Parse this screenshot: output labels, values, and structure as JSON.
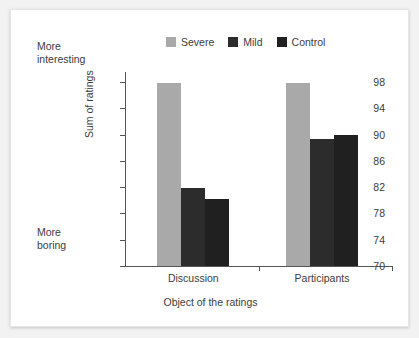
{
  "chart_data": {
    "type": "bar",
    "title": "",
    "xlabel": "Object of the ratings",
    "ylabel": "Sum of ratings",
    "categories": [
      "Discussion",
      "Participants"
    ],
    "series": [
      {
        "name": "Severe",
        "color": "#a9a9a9",
        "values": [
          97.8,
          97.9
        ]
      },
      {
        "name": "Mild",
        "color": "#2c2c2c",
        "values": [
          81.9,
          89.4
        ]
      },
      {
        "name": "Control",
        "color": "#202020",
        "values": [
          80.2,
          89.9
        ]
      }
    ],
    "ylim": [
      70,
      100
    ],
    "yticks": [
      70,
      74,
      78,
      82,
      86,
      90,
      94,
      98
    ],
    "grid": false,
    "legend_position": "top-center",
    "annotations": [
      {
        "name": "more-interesting",
        "line1": "More",
        "line2": "interesting",
        "position": "axis-top-left"
      },
      {
        "name": "more-boring",
        "line1": "More",
        "line2": "boring",
        "position": "axis-bottom-left"
      }
    ]
  },
  "legend": {
    "items": [
      {
        "label": "Severe",
        "color": "#a9a9a9"
      },
      {
        "label": "Mild",
        "color": "#2c2c2c"
      },
      {
        "label": "Control",
        "color": "#202020"
      }
    ]
  },
  "annotations": {
    "top": {
      "line1": "More",
      "line2": "interesting"
    },
    "bottom": {
      "line1": "More",
      "line2": "boring"
    }
  },
  "axes": {
    "y_title": "Sum of ratings",
    "x_title": "Object of the ratings",
    "y_ticks": [
      "98",
      "94",
      "90",
      "86",
      "82",
      "78",
      "74",
      "70"
    ],
    "x_labels": [
      "Discussion",
      "Participants"
    ]
  }
}
